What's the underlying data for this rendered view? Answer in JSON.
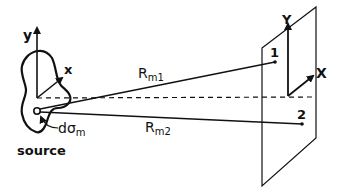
{
  "diagram": {
    "source": {
      "label": "source",
      "element_label": "dσ",
      "element_sub": "m",
      "axis_y": "y",
      "axis_x": "x"
    },
    "plane": {
      "axis_y": "Y",
      "axis_x": "X",
      "point1": "1",
      "point2": "2"
    },
    "rays": {
      "r1_main": "R",
      "r1_sub": "m1",
      "r2_main": "R",
      "r2_sub": "m2"
    },
    "colors": {
      "stroke": "#111111",
      "background": "#ffffff"
    }
  }
}
